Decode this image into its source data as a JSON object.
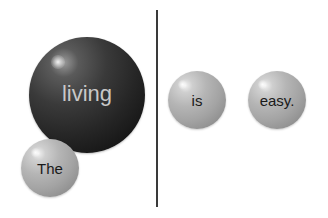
{
  "diagram": {
    "left_panel": {
      "spheres": [
        {
          "word": "living",
          "style": "dark",
          "text_color": "#cfcfcf"
        },
        {
          "word": "The",
          "style": "light",
          "text_color": "#1a1a1a"
        }
      ]
    },
    "right_panel": {
      "spheres": [
        {
          "word": "is",
          "style": "light",
          "text_color": "#1a1a1a"
        },
        {
          "word": "easy.",
          "style": "light",
          "text_color": "#1a1a1a"
        }
      ]
    },
    "divider": {
      "orientation": "vertical",
      "color": "#3a3a3a"
    }
  }
}
